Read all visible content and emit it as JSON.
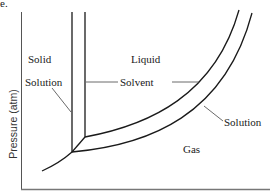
{
  "figure": {
    "panel_label": "e.",
    "y_axis_label": "Pressure (atm)",
    "x_axis_label": ""
  },
  "regions": {
    "solid": "Solid",
    "liquid": "Liquid",
    "gas": "Gas"
  },
  "callouts": {
    "solution_left": "Solution",
    "solvent": "Solvent",
    "solution_right": "Solution"
  },
  "colors": {
    "line": "#1a1a1a",
    "axis": "#555555",
    "leader": "#444444",
    "background": "#ffffff"
  }
}
